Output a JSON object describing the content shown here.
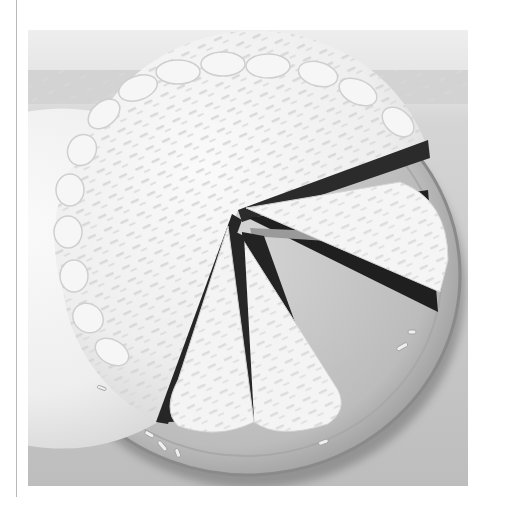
{
  "page": {
    "background": "#ffffff",
    "margin_rule": {
      "color": "#b9b9b9"
    }
  },
  "photo": {
    "subject": "frosted layer cake with white chocolate shavings on a platter, slices cut",
    "palette": {
      "backdrop_top": "#e9e9e9",
      "tablecloth": "#c8c8c8",
      "fringe": "#d9d9d9",
      "platter": "#bdbdbd",
      "platter_rim": "#8e8e8e",
      "platter_shadow": "#5a5a5a",
      "frosting": "#f4f4f4",
      "frosting_shade": "#dcdcdc",
      "sponge": "#2a2a2a",
      "filling": "#9a9a9a"
    },
    "slices_cut": 3
  }
}
